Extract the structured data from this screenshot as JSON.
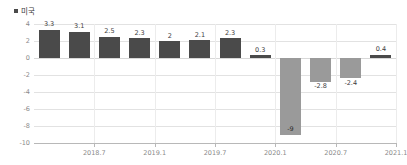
{
  "legend": {
    "marker_name": "legend-swatch",
    "label": "미국",
    "color": "#4a4a4a"
  },
  "colors": {
    "positive_bar": "#4a4a4a",
    "negative_bar": "#9a9a9a",
    "gridline": "#e2e2e2",
    "axis": "#b8b8b8",
    "tick_text": "#8a8a8a",
    "label_text": "#3c3c3c"
  },
  "chart_data": {
    "type": "bar",
    "title": "",
    "subtitle": "",
    "xlabel": "",
    "ylabel": "",
    "legend": [
      "미국"
    ],
    "legend_position": "top-left",
    "grid": true,
    "ylim": [
      -10,
      4
    ],
    "yticks": [
      4,
      2,
      0,
      -2,
      -4,
      -6,
      -8,
      -10
    ],
    "ytick_labels": [
      "4",
      "2",
      "0",
      "-2",
      "-4",
      "-6",
      "-8",
      "-10"
    ],
    "xticks": [
      "2018.7",
      "2019.1",
      "2019.7",
      "2020.1",
      "2020.7",
      "2021.1"
    ],
    "xtick_positions": [
      2.0,
      4.0,
      6.0,
      8.0,
      10.0,
      12.0
    ],
    "categories": [
      "",
      "",
      "",
      "",
      "",
      "",
      "",
      "",
      "",
      "",
      "",
      ""
    ],
    "values": [
      3.3,
      3.1,
      2.5,
      2.3,
      2,
      2.1,
      2.3,
      0.3,
      -9,
      -2.8,
      -2.4,
      0.4
    ],
    "value_labels": [
      "3.3",
      "3.1",
      "2.5",
      "2.3",
      "2",
      "2.1",
      "2.3",
      "0.3",
      "-9",
      "-2.8",
      "-2.4",
      "0.4"
    ]
  }
}
